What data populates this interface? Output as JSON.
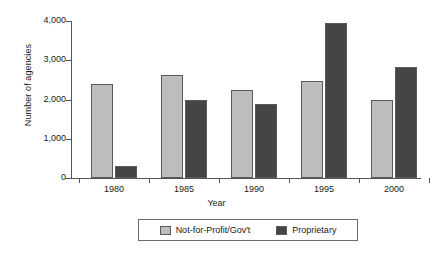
{
  "chart_data": {
    "type": "bar",
    "title": "",
    "xlabel": "Year",
    "ylabel": "Number of agencies",
    "categories": [
      "1980",
      "1985",
      "1990",
      "1995",
      "2000"
    ],
    "series": [
      {
        "name": "Not-for-Profit/Gov't",
        "color": "#bdbdbd",
        "values": [
          2400,
          2620,
          2230,
          2480,
          1990
        ]
      },
      {
        "name": "Proprietary",
        "color": "#454545",
        "values": [
          300,
          1980,
          1890,
          3950,
          2840
        ]
      }
    ],
    "ylim": [
      0,
      4000
    ],
    "yticks": [
      0,
      1000,
      2000,
      3000,
      4000
    ],
    "ytick_labels": [
      "0",
      "1,000",
      "2,000",
      "3,000",
      "4,000"
    ],
    "grid": false,
    "legend_position": "bottom-center"
  },
  "axes": {
    "y_title": "Number of agencies",
    "x_title": "Year"
  },
  "legend": {
    "entries": [
      {
        "label": "Not-for-Profit/Gov't",
        "swatch_name": "legend-swatch-not-for-profit"
      },
      {
        "label": "Proprietary",
        "swatch_name": "legend-swatch-proprietary"
      }
    ]
  }
}
